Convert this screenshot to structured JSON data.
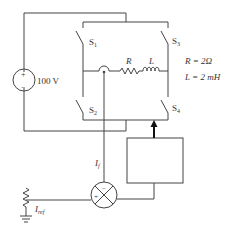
{
  "source": {
    "label": "100 V",
    "plus": "+",
    "minus": "−"
  },
  "switches": [
    {
      "id": "S1",
      "label": "S",
      "sub": "1"
    },
    {
      "id": "S2",
      "label": "S",
      "sub": "2"
    },
    {
      "id": "S3",
      "label": "S",
      "sub": "3"
    },
    {
      "id": "S4",
      "label": "S",
      "sub": "4"
    }
  ],
  "load": {
    "r_label": "R",
    "l_label": "L"
  },
  "params": {
    "r_value": "R = 2Ω",
    "l_value": "L = 2 mH"
  },
  "feedback": {
    "current_label": "I",
    "current_sub": "f"
  },
  "reference": {
    "label": "I",
    "sub": "ref"
  },
  "summer": {
    "plus": "+",
    "minus": "−"
  },
  "controller": {
    "label": ""
  },
  "colors": {
    "wire": "#444444",
    "background": "#ffffff"
  }
}
